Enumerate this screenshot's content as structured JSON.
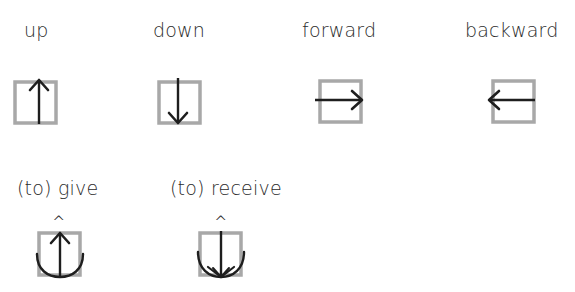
{
  "colors": {
    "box_stroke": "#a8a8a8",
    "arrow_stroke": "#1e1e1e",
    "text": "#2b2b2b",
    "background": "#ffffff"
  },
  "row1": {
    "items": [
      {
        "label": "up",
        "icon": "box-arrow-up-icon"
      },
      {
        "label": "down",
        "icon": "box-arrow-down-icon"
      },
      {
        "label": "forward",
        "icon": "box-arrow-right-icon"
      },
      {
        "label": "backward",
        "icon": "box-arrow-left-icon"
      }
    ]
  },
  "row2": {
    "items": [
      {
        "label": "(to) give",
        "marker": "^",
        "icon": "box-arrow-up-with-curve-icon"
      },
      {
        "label": "(to) receive",
        "marker": "^",
        "icon": "box-arrow-down-with-curve-icon"
      }
    ]
  }
}
